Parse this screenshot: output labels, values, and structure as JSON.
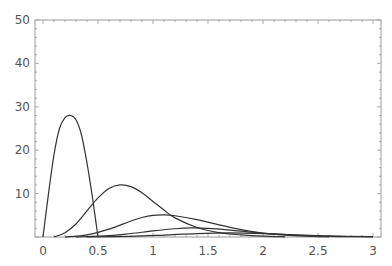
{
  "chart_data": {
    "type": "line",
    "title": "",
    "xlabel": "",
    "ylabel": "",
    "xlim": [
      -0.07,
      3.07
    ],
    "ylim": [
      0,
      50
    ],
    "grid": false,
    "legend": null,
    "x_ticks": [
      {
        "value": 0,
        "label": "0"
      },
      {
        "value": 0.5,
        "label": "0.5"
      },
      {
        "value": 1,
        "label": "1"
      },
      {
        "value": 1.5,
        "label": "1.5"
      },
      {
        "value": 2,
        "label": "2"
      },
      {
        "value": 2.5,
        "label": "2.5"
      },
      {
        "value": 3,
        "label": "3"
      }
    ],
    "y_ticks": [
      {
        "value": 10,
        "label": "10"
      },
      {
        "value": 20,
        "label": "20"
      },
      {
        "value": 30,
        "label": "30"
      },
      {
        "value": 40,
        "label": "40"
      },
      {
        "value": 50,
        "label": "50"
      }
    ],
    "series": [
      {
        "name": "curve-1",
        "x": [
          0,
          0.05,
          0.1,
          0.15,
          0.2,
          0.25,
          0.3,
          0.35,
          0.4,
          0.45,
          0.5
        ],
        "y": [
          0,
          10,
          19,
          25,
          27.5,
          28,
          27,
          23.5,
          17,
          9,
          0
        ]
      },
      {
        "name": "curve-2",
        "x": [
          0.1,
          0.2,
          0.3,
          0.4,
          0.5,
          0.6,
          0.7,
          0.8,
          0.9,
          1.0,
          1.1,
          1.2,
          1.4,
          1.6,
          1.8,
          2.0,
          2.2
        ],
        "y": [
          0,
          1,
          3,
          6,
          9,
          11.2,
          12,
          11.6,
          10.2,
          8.2,
          6.2,
          4.4,
          2.2,
          1.0,
          0.5,
          0.2,
          0.05
        ]
      },
      {
        "name": "curve-3",
        "x": [
          0.2,
          0.4,
          0.6,
          0.8,
          0.9,
          1.0,
          1.1,
          1.2,
          1.4,
          1.6,
          1.8,
          2.0,
          2.2,
          2.4,
          2.6
        ],
        "y": [
          0,
          0.5,
          1.8,
          3.7,
          4.5,
          5.0,
          5.1,
          4.9,
          4.0,
          2.8,
          1.7,
          0.9,
          0.45,
          0.2,
          0.05
        ]
      },
      {
        "name": "curve-4",
        "x": [
          0.3,
          0.6,
          0.8,
          1.0,
          1.2,
          1.35,
          1.5,
          1.7,
          1.9,
          2.1,
          2.4,
          2.7,
          3.0
        ],
        "y": [
          0,
          0.3,
          0.8,
          1.4,
          1.9,
          2.1,
          2.0,
          1.6,
          1.1,
          0.7,
          0.3,
          0.1,
          0.03
        ]
      },
      {
        "name": "curve-5",
        "x": [
          0.4,
          0.8,
          1.1,
          1.4,
          1.7,
          2.0,
          2.3,
          2.6,
          3.0
        ],
        "y": [
          0,
          0.15,
          0.45,
          0.8,
          0.95,
          0.8,
          0.5,
          0.25,
          0.08
        ]
      }
    ]
  },
  "plot_area": {
    "left": 35,
    "right": 381,
    "top": 20,
    "bottom": 237,
    "x0_px": 43,
    "x3_px": 373
  },
  "colors": {
    "frame": "#9a9a9a",
    "curve": "#333333",
    "label": "#555555",
    "background": "#ffffff"
  }
}
